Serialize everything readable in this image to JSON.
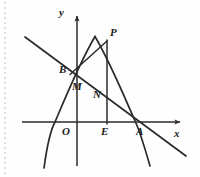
{
  "figure": {
    "kind": "coordinate-geometry-diagram",
    "background_color": "#fefefe",
    "stroke_color": "#2b2b2b",
    "label_color": "#1a1a1a",
    "width": 200,
    "height": 177
  },
  "axes": {
    "x_label": "x",
    "y_label": "y",
    "origin_label": "O",
    "x_axis_y": 122,
    "y_axis_x": 77,
    "x_axis_start": 22,
    "x_axis_end": 182,
    "y_axis_top": 14,
    "y_axis_bottom": 166
  },
  "points": [
    {
      "name": "P",
      "label": "P",
      "x": 107,
      "y": 40,
      "label_x": 110,
      "label_y": 27
    },
    {
      "name": "B",
      "label": "B",
      "x": 72,
      "y": 72,
      "label_x": 60,
      "label_y": 65
    },
    {
      "name": "M",
      "label": "M",
      "x": 79,
      "y": 80,
      "label_x": 74,
      "label_y": 83
    },
    {
      "name": "N",
      "label": "N",
      "x": 107,
      "y": 94,
      "label_x": 94,
      "label_y": 91
    },
    {
      "name": "E",
      "label": "E",
      "x": 107,
      "y": 122,
      "label_x": 101,
      "label_y": 127
    },
    {
      "name": "A",
      "label": "A",
      "x": 146,
      "y": 122,
      "label_x": 136,
      "label_y": 127
    },
    {
      "name": "O",
      "label": "O",
      "x": 77,
      "y": 122,
      "label_x": 62,
      "label_y": 127
    }
  ],
  "curves": {
    "parabola": {
      "name": "downward-parabola",
      "vertex_x": 95,
      "vertex_y": 36,
      "x_intercept_left": 55,
      "x_intercept_right": 146,
      "path": "M 44,168 Q 49,134 55,122 Q 72,82 95,36 Q 118,82 146,122 Q 150,133 155,166"
    },
    "line": {
      "name": "descending-line",
      "from_x": 25,
      "from_y": 37,
      "to_x": 186,
      "to_y": 156
    },
    "segment_bp": {
      "name": "segment-B-to-P",
      "from_x": 70,
      "from_y": 74,
      "to_x": 107,
      "to_y": 41
    },
    "segment_pe": {
      "name": "vertical-segment-P-to-E",
      "from_x": 107,
      "from_y": 40,
      "to_x": 107,
      "to_y": 124
    }
  },
  "artifacts": {
    "left_scan_edge": "dotted-scan-margin"
  }
}
